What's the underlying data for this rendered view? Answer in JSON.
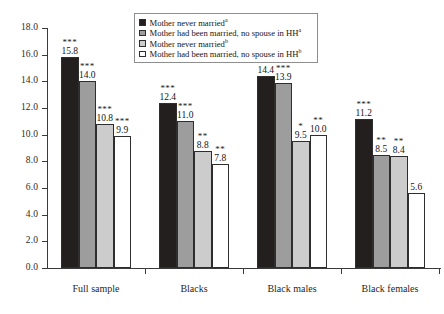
{
  "chart_data": {
    "type": "bar",
    "title": "",
    "xlabel": "",
    "ylabel": "",
    "ylim": [
      0.0,
      18.0
    ],
    "ytick_step": 2.0,
    "ytick_labels": [
      "0.0",
      "2.0",
      "4.0",
      "6.0",
      "8.0",
      "10.0",
      "12.0",
      "14.0",
      "16.0",
      "18.0"
    ],
    "grid": false,
    "legend_position": "top-center",
    "categories": [
      "Full sample",
      "Blacks",
      "Black males",
      "Black females"
    ],
    "series": [
      {
        "name": "Mother never married",
        "superscript": "a",
        "color": "#231f1e",
        "values": [
          15.8,
          12.4,
          14.4,
          11.2
        ],
        "value_labels": [
          "15.8",
          "12.4",
          "14.4",
          "11.2"
        ],
        "significance": [
          "***",
          "***",
          "***",
          "***"
        ]
      },
      {
        "name": "Mother had been married, no spouse in HH",
        "superscript": "a",
        "color": "#9d9d9d",
        "values": [
          14.0,
          11.0,
          13.9,
          8.5
        ],
        "value_labels": [
          "14.0",
          "11.0",
          "13.9",
          "8.5"
        ],
        "significance": [
          "***",
          "***",
          "***",
          "**"
        ]
      },
      {
        "name": "Mother never married",
        "superscript": "b",
        "color": "#cccccc",
        "values": [
          10.8,
          8.8,
          9.5,
          8.4
        ],
        "value_labels": [
          "10.8",
          "8.8",
          "9.5",
          "8.4"
        ],
        "significance": [
          "***",
          "**",
          "*",
          "**"
        ]
      },
      {
        "name": "Mother had been married, no spouse in HH",
        "superscript": "b",
        "color": "#ffffff",
        "values": [
          9.9,
          7.8,
          10.0,
          5.6
        ],
        "value_labels": [
          "9.9",
          "7.8",
          "10.0",
          "5.6"
        ],
        "significance": [
          "***",
          "**",
          "**",
          ""
        ]
      }
    ]
  },
  "legend": {
    "entries": [
      {
        "label": "Mother never married",
        "superscript": "a",
        "swatch": "#231f1e"
      },
      {
        "label": "Mother had been married, no spouse in HH",
        "superscript": "a",
        "swatch": "#9d9d9d"
      },
      {
        "label": "Mother never married",
        "superscript": "b",
        "swatch": "#cccccc"
      },
      {
        "label": "Mother had been married, no spouse in HH",
        "superscript": "b",
        "swatch": "#ffffff"
      }
    ]
  },
  "top_clipped_caption": "Mother never married  Mother had been married  Mother never"
}
